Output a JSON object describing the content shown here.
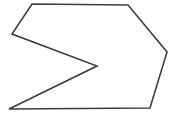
{
  "figure": {
    "shape_type": "polygon",
    "background_color": "#ffffff",
    "stroke_color": "#3d3d3d",
    "stroke_width": "1.6",
    "fill_color": "none",
    "viewbox": "0 0 179 116",
    "points": "32,4 128,5 167,52 150,108 9,109 97,66 12,34",
    "vertices": [
      {
        "name": "top-left",
        "x": 32,
        "y": 4
      },
      {
        "name": "top-right",
        "x": 128,
        "y": 5
      },
      {
        "name": "right-bend",
        "x": 167,
        "y": 52
      },
      {
        "name": "bottom-right",
        "x": 150,
        "y": 108
      },
      {
        "name": "bottom-left",
        "x": 9,
        "y": 109
      },
      {
        "name": "notch-tip",
        "x": 97,
        "y": 66
      },
      {
        "name": "left-vertex",
        "x": 12,
        "y": 34
      }
    ]
  }
}
